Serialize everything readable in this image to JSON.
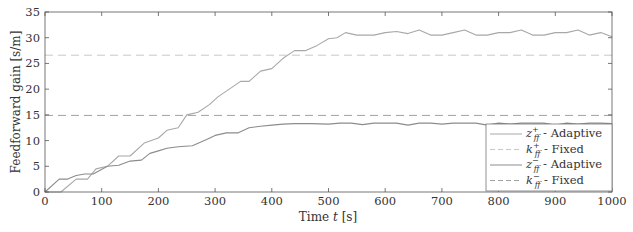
{
  "chart_data": {
    "type": "line",
    "title": "",
    "xlabel": "Time t [s]",
    "ylabel": "Feedforward gain [s/m]",
    "xlim": [
      0,
      1000
    ],
    "ylim": [
      0,
      35
    ],
    "xticks": [
      0,
      100,
      200,
      300,
      400,
      500,
      600,
      700,
      800,
      900,
      1000
    ],
    "yticks": [
      0,
      5,
      10,
      15,
      20,
      25,
      30,
      35
    ],
    "grid": false,
    "legend_position": "lower right",
    "series": [
      {
        "name": "z_ff^+ - Adaptive",
        "style": "solid",
        "color": "#a8a8a8",
        "x": [
          0,
          28,
          55,
          75,
          90,
          110,
          130,
          150,
          175,
          200,
          215,
          235,
          250,
          270,
          290,
          305,
          325,
          345,
          360,
          380,
          400,
          420,
          440,
          460,
          480,
          500,
          515,
          530,
          550,
          580,
          600,
          620,
          640,
          660,
          680,
          700,
          720,
          740,
          760,
          780,
          800,
          820,
          840,
          860,
          880,
          900,
          920,
          940,
          960,
          980,
          1000
        ],
        "y": [
          0,
          0,
          2.5,
          2.5,
          4.5,
          5,
          7,
          7,
          9.5,
          10.5,
          12,
          12.5,
          15,
          15.5,
          17,
          18.5,
          20,
          21.5,
          21.5,
          23.5,
          24,
          26,
          27.5,
          27.5,
          28.5,
          29.8,
          30,
          31,
          30.5,
          30.5,
          31,
          31.2,
          30.8,
          31.5,
          30.5,
          30.5,
          31,
          31.5,
          30.5,
          30.5,
          31,
          31,
          31.5,
          30.5,
          30.5,
          31,
          31,
          31.5,
          30.5,
          31,
          30.2
        ]
      },
      {
        "name": "k_ff^+ - Fixed",
        "style": "dashed",
        "color": "#c8c8c8",
        "x": [
          0,
          1000
        ],
        "y": [
          26.6,
          26.6
        ]
      },
      {
        "name": "z_ff^- - Adaptive",
        "style": "solid",
        "color": "#8c8c8c",
        "x": [
          0,
          25,
          40,
          55,
          70,
          85,
          110,
          130,
          150,
          170,
          185,
          200,
          215,
          235,
          260,
          285,
          300,
          320,
          340,
          360,
          380,
          400,
          420,
          440,
          470,
          500,
          520,
          540,
          560,
          580,
          600,
          620,
          640,
          660,
          680,
          700,
          720,
          740,
          760,
          780,
          800,
          820,
          840,
          860,
          880,
          900,
          920,
          940,
          960,
          980,
          1000
        ],
        "y": [
          0,
          2.5,
          2.5,
          3.2,
          3.5,
          3.5,
          5,
          5.2,
          6,
          6.2,
          7.5,
          8,
          8.5,
          8.8,
          9,
          10.2,
          11,
          11.5,
          11.5,
          12.5,
          12.8,
          13,
          13.2,
          13.3,
          13.3,
          13.2,
          13.4,
          13.4,
          13.1,
          13.4,
          13.4,
          13.4,
          13,
          13.4,
          13.4,
          13.2,
          13.4,
          13.4,
          13.4,
          13,
          13.4,
          13.2,
          13.4,
          13.4,
          13.4,
          13,
          13.4,
          13.2,
          13.4,
          13.4,
          13.3
        ]
      },
      {
        "name": "k_ff^- - Fixed",
        "style": "dashed",
        "color": "#a0a0a0",
        "x": [
          0,
          1000
        ],
        "y": [
          14.9,
          14.9
        ]
      }
    ]
  },
  "axes": {
    "xlabel_prefix": "Time ",
    "xlabel_var": "t",
    "xlabel_unit": " [s]",
    "ylabel": "Feedforward gain [s/m]"
  },
  "legend": {
    "items": [
      {
        "sym": "z",
        "sup": "+",
        "sub": "ff",
        "text": " - Adaptive"
      },
      {
        "sym": "k",
        "sup": "+",
        "sub": "ff",
        "text": " - Fixed"
      },
      {
        "sym": "z",
        "sup": "−",
        "sub": "ff",
        "text": " - Adaptive"
      },
      {
        "sym": "k",
        "sup": "−",
        "sub": "ff",
        "text": " - Fixed"
      }
    ]
  },
  "colors": {
    "axis": "#555555",
    "text": "#333333",
    "background": "#ffffff"
  }
}
